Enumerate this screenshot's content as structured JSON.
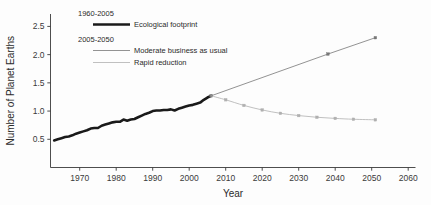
{
  "chart_data": {
    "type": "line",
    "title": "",
    "xlabel": "Year",
    "ylabel": "Number of Planet Earths",
    "xlim": [
      1962,
      2062
    ],
    "ylim": [
      0.0,
      2.72
    ],
    "grid": false,
    "legend_position": "top-left-inside",
    "xticks": [
      1970,
      1980,
      1990,
      2000,
      2010,
      2020,
      2030,
      2040,
      2050,
      2060
    ],
    "xtick_labels": [
      "1970",
      "1980",
      "1990",
      "2000",
      "2010",
      "2020",
      "2030",
      "2040",
      "2050",
      "2060"
    ],
    "yticks": [
      0.5,
      1.0,
      1.5,
      2.0,
      2.5
    ],
    "ytick_labels": [
      "0.5",
      "1.0",
      "1.5",
      "2.0",
      "2.5"
    ],
    "legend_groups": [
      {
        "header": "1960-2005",
        "entries": [
          {
            "label": "Ecological footprint",
            "color": "#1a1a1a",
            "width": 2.6
          }
        ]
      },
      {
        "header": "2005-2050",
        "entries": [
          {
            "label": "Moderate business as usual",
            "color": "#777777",
            "width": 0.8
          },
          {
            "label": "Rapid reduction",
            "color": "#b0b0b0",
            "width": 0.8
          }
        ]
      }
    ],
    "series": [
      {
        "name": "Ecological footprint",
        "period": "1960-2005",
        "color": "#1a1a1a",
        "width": 2.6,
        "markers": false,
        "points": [
          [
            1963,
            0.48
          ],
          [
            1964,
            0.5
          ],
          [
            1965,
            0.52
          ],
          [
            1966,
            0.54
          ],
          [
            1967,
            0.55
          ],
          [
            1968,
            0.57
          ],
          [
            1969,
            0.6
          ],
          [
            1970,
            0.62
          ],
          [
            1971,
            0.64
          ],
          [
            1972,
            0.66
          ],
          [
            1973,
            0.69
          ],
          [
            1974,
            0.7
          ],
          [
            1975,
            0.7
          ],
          [
            1976,
            0.74
          ],
          [
            1977,
            0.76
          ],
          [
            1978,
            0.78
          ],
          [
            1979,
            0.8
          ],
          [
            1980,
            0.81
          ],
          [
            1981,
            0.81
          ],
          [
            1982,
            0.85
          ],
          [
            1983,
            0.83
          ],
          [
            1984,
            0.85
          ],
          [
            1985,
            0.86
          ],
          [
            1986,
            0.89
          ],
          [
            1987,
            0.92
          ],
          [
            1988,
            0.95
          ],
          [
            1989,
            0.97
          ],
          [
            1990,
            1.0
          ],
          [
            1991,
            1.01
          ],
          [
            1992,
            1.01
          ],
          [
            1993,
            1.02
          ],
          [
            1994,
            1.02
          ],
          [
            1995,
            1.03
          ],
          [
            1996,
            1.01
          ],
          [
            1997,
            1.04
          ],
          [
            1998,
            1.06
          ],
          [
            1999,
            1.08
          ],
          [
            2000,
            1.1
          ],
          [
            2001,
            1.11
          ],
          [
            2002,
            1.13
          ],
          [
            2003,
            1.15
          ],
          [
            2004,
            1.2
          ],
          [
            2005,
            1.24
          ],
          [
            2006,
            1.27
          ]
        ]
      },
      {
        "name": "Moderate business as usual",
        "period": "2005-2050",
        "color": "#777777",
        "width": 0.8,
        "markers": true,
        "points": [
          [
            2006,
            1.27
          ],
          [
            2038,
            2.01
          ],
          [
            2051,
            2.3
          ]
        ]
      },
      {
        "name": "Rapid reduction",
        "period": "2005-2050",
        "color": "#b0b0b0",
        "width": 0.8,
        "markers": true,
        "points": [
          [
            2006,
            1.27
          ],
          [
            2010,
            1.2
          ],
          [
            2015,
            1.1
          ],
          [
            2020,
            1.02
          ],
          [
            2025,
            0.96
          ],
          [
            2030,
            0.92
          ],
          [
            2035,
            0.89
          ],
          [
            2040,
            0.87
          ],
          [
            2045,
            0.855
          ],
          [
            2051,
            0.845
          ]
        ]
      }
    ]
  }
}
